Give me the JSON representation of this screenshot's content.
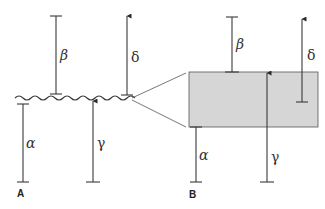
{
  "diagram": {
    "panels": [
      {
        "id": "A",
        "label": "A",
        "surface": "wavy-line",
        "vectors": [
          {
            "name": "alpha",
            "symbol": "α",
            "type": "bar"
          },
          {
            "name": "beta",
            "symbol": "β",
            "type": "bar"
          },
          {
            "name": "gamma",
            "symbol": "γ",
            "type": "arrow-up"
          },
          {
            "name": "delta",
            "symbol": "δ",
            "type": "arrow-up"
          }
        ]
      },
      {
        "id": "B",
        "label": "B",
        "surface": "shaded-band",
        "vectors": [
          {
            "name": "alpha",
            "symbol": "α",
            "type": "bar"
          },
          {
            "name": "beta",
            "symbol": "β",
            "type": "bar"
          },
          {
            "name": "gamma",
            "symbol": "γ",
            "type": "arrow-up"
          },
          {
            "name": "delta",
            "symbol": "δ",
            "type": "arrow-up"
          }
        ]
      }
    ],
    "colors": {
      "line": "#3a3a3a",
      "band_fill": "#d6d6d6",
      "band_stroke": "#555555",
      "background": "#ffffff"
    }
  }
}
